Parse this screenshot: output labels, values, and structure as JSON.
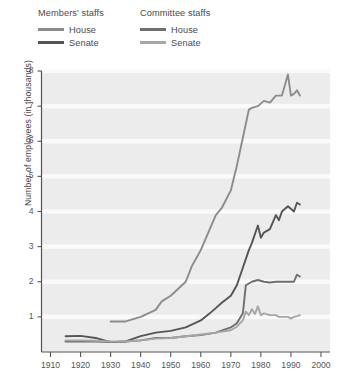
{
  "legend": {
    "groups": [
      {
        "title": "Members' staffs",
        "entries": [
          {
            "label": "House",
            "color": "#8c8c8c"
          },
          {
            "label": "Senate",
            "color": "#555555"
          }
        ]
      },
      {
        "title": "Committee staffs",
        "entries": [
          {
            "label": "House",
            "color": "#6e6e6e"
          },
          {
            "label": "Senate",
            "color": "#a6a6a6"
          }
        ]
      }
    ]
  },
  "chart_data": {
    "type": "line",
    "title": "",
    "xlabel": "",
    "ylabel": "Number of employees (in thousands)",
    "xlim": [
      1907,
      2003
    ],
    "ylim": [
      0,
      8
    ],
    "xticks": [
      1910,
      1920,
      1930,
      1940,
      1950,
      1960,
      1970,
      1980,
      1990,
      2000
    ],
    "yticks": [
      1,
      2,
      3,
      4,
      5,
      6,
      7,
      8
    ],
    "grid": "horizontal-white",
    "plot_background": "#ececec",
    "legend_position": "above-plot-left",
    "series": [
      {
        "name": "Members' staffs — House",
        "group": "Members' staffs",
        "chamber": "House",
        "color": "#8c8c8c",
        "x": [
          1930,
          1935,
          1940,
          1945,
          1947,
          1950,
          1955,
          1957,
          1960,
          1963,
          1965,
          1967,
          1970,
          1972,
          1974,
          1976,
          1977,
          1979,
          1981,
          1983,
          1985,
          1987,
          1989,
          1990,
          1991,
          1992,
          1993
        ],
        "y": [
          0.87,
          0.87,
          1.0,
          1.2,
          1.44,
          1.6,
          2.0,
          2.44,
          2.9,
          3.5,
          3.9,
          4.1,
          4.6,
          5.3,
          6.1,
          6.9,
          6.95,
          7.0,
          7.15,
          7.1,
          7.3,
          7.3,
          7.9,
          7.3,
          7.35,
          7.45,
          7.3
        ]
      },
      {
        "name": "Members' staffs — Senate",
        "group": "Members' staffs",
        "chamber": "Senate",
        "color": "#555555",
        "x": [
          1915,
          1920,
          1925,
          1930,
          1935,
          1940,
          1945,
          1950,
          1955,
          1960,
          1963,
          1965,
          1967,
          1970,
          1972,
          1974,
          1976,
          1977,
          1979,
          1980,
          1981,
          1983,
          1985,
          1986,
          1987,
          1989,
          1991,
          1992,
          1993
        ],
        "y": [
          0.45,
          0.46,
          0.4,
          0.28,
          0.3,
          0.45,
          0.55,
          0.6,
          0.7,
          0.9,
          1.1,
          1.25,
          1.4,
          1.6,
          1.9,
          2.4,
          2.9,
          3.1,
          3.6,
          3.25,
          3.4,
          3.5,
          3.9,
          3.75,
          4.0,
          4.15,
          4.0,
          4.25,
          4.2
        ]
      },
      {
        "name": "Committee staffs — House",
        "group": "Committee staffs",
        "chamber": "House",
        "color": "#6e6e6e",
        "x": [
          1915,
          1920,
          1925,
          1930,
          1935,
          1940,
          1945,
          1950,
          1955,
          1960,
          1965,
          1970,
          1972,
          1974,
          1975,
          1977,
          1979,
          1981,
          1983,
          1985,
          1987,
          1989,
          1991,
          1992,
          1993
        ],
        "y": [
          0.3,
          0.3,
          0.3,
          0.28,
          0.3,
          0.33,
          0.4,
          0.4,
          0.45,
          0.48,
          0.55,
          0.7,
          0.82,
          1.1,
          1.9,
          2.0,
          2.05,
          2.0,
          1.98,
          2.0,
          2.0,
          2.0,
          2.0,
          2.2,
          2.15
        ]
      },
      {
        "name": "Committee staffs — Senate",
        "group": "Committee staffs",
        "chamber": "Senate",
        "color": "#a6a6a6",
        "x": [
          1915,
          1920,
          1925,
          1930,
          1935,
          1940,
          1945,
          1950,
          1955,
          1960,
          1965,
          1970,
          1972,
          1974,
          1975,
          1976,
          1977,
          1978,
          1979,
          1980,
          1981,
          1983,
          1985,
          1986,
          1987,
          1989,
          1990,
          1991,
          1992,
          1993
        ],
        "y": [
          0.33,
          0.33,
          0.32,
          0.3,
          0.3,
          0.33,
          0.38,
          0.4,
          0.45,
          0.5,
          0.55,
          0.62,
          0.72,
          0.9,
          1.15,
          1.05,
          1.22,
          1.08,
          1.3,
          1.05,
          1.1,
          1.05,
          1.05,
          1.0,
          1.0,
          1.0,
          0.95,
          1.0,
          1.02,
          1.05
        ]
      }
    ]
  }
}
